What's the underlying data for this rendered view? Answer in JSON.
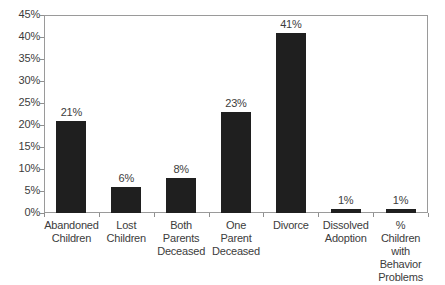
{
  "chart_data": {
    "type": "bar",
    "title": "",
    "subtitle": "",
    "xlabel": "",
    "ylabel": "",
    "ylim": [
      0,
      45
    ],
    "ytick_step": 5,
    "ytick_labels": [
      "0%",
      "5%",
      "10%",
      "15%",
      "20%",
      "25%",
      "30%",
      "35%",
      "40%",
      "45%"
    ],
    "ytick_values": [
      0,
      5,
      10,
      15,
      20,
      25,
      30,
      35,
      40,
      45
    ],
    "grid": false,
    "legend": null,
    "bar_color": "#1f1f1f",
    "frame_color": "#9a9a9a",
    "categories": [
      "Abandoned Children",
      "Lost Children",
      "Both Parents Deceased",
      "One Parent Deceased",
      "Divorce",
      "Dissolved Adoption",
      "% Children with Behavior Problems"
    ],
    "category_label_lines": [
      [
        "Abandoned",
        "Children"
      ],
      [
        "Lost",
        "Children"
      ],
      [
        "Both",
        "Parents",
        "Deceased"
      ],
      [
        "One",
        "Parent",
        "Deceased"
      ],
      [
        "Divorce"
      ],
      [
        "Dissolved",
        "Adoption"
      ],
      [
        "%",
        "Children",
        "with",
        "Behavior",
        "Problems"
      ]
    ],
    "values": [
      21,
      6,
      8,
      23,
      41,
      1,
      1
    ],
    "data_labels": [
      "21%",
      "6%",
      "8%",
      "23%",
      "41%",
      "1%",
      "1%"
    ]
  }
}
